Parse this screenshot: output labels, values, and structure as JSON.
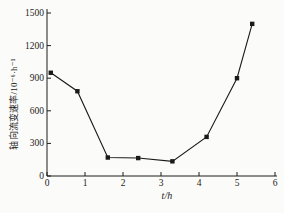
{
  "figure": {
    "background": "#fbfbf9",
    "axis_color": "#1c1c1c",
    "text_color": "#1c1c1c"
  },
  "chart_data": {
    "type": "line",
    "title": "",
    "xlabel": "t/h",
    "ylabel": "轴向流变速率/10⁻⁶·h⁻¹",
    "xlim": [
      0,
      6
    ],
    "ylim": [
      0,
      1500
    ],
    "xticks": [
      0,
      1,
      2,
      3,
      4,
      5,
      6
    ],
    "yticks": [
      0,
      300,
      600,
      900,
      1200,
      1500
    ],
    "grid": false,
    "legend": false,
    "series": [
      {
        "name": "axial-creep-rate",
        "marker": "square",
        "color": "#1a1a1a",
        "x": [
          0.1,
          0.8,
          1.6,
          2.4,
          3.3,
          4.2,
          5.0,
          5.4
        ],
        "y": [
          950,
          780,
          170,
          165,
          135,
          360,
          900,
          1400
        ]
      }
    ]
  }
}
